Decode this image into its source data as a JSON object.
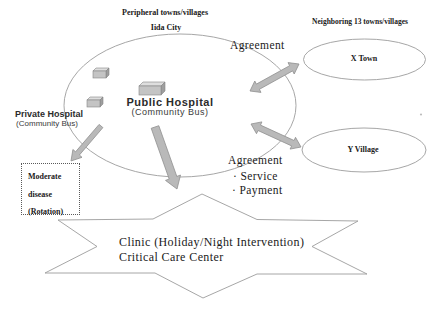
{
  "headers": {
    "peripheral_line1": "Peripheral towns/villages",
    "peripheral_line2": "Iida City",
    "neighboring": "Neighboring 13 towns/villages"
  },
  "main_ellipse": {
    "hospital_name": "Public Hospital",
    "hospital_sub": "(Community Bus)"
  },
  "private_hospital": {
    "name": "Private Hospital",
    "sub": "(Community Bus)"
  },
  "agreements": {
    "top_label": "Agreement",
    "bottom_label": "Agreement",
    "bottom_items": [
      "· Service",
      "· Payment"
    ]
  },
  "neighbors": {
    "x_town": "X Town",
    "y_village": "Y Village"
  },
  "moderate_box": {
    "lines": [
      "Moderate",
      "disease",
      "(Rotation)"
    ]
  },
  "burst": {
    "line1": "Clinic (Holiday/Night Intervention)",
    "line2": "Critical Care Center"
  },
  "icons": {
    "community_bus": "3d-box-shape"
  },
  "colors": {
    "arrow_fill": "#b9b9b9",
    "arrow_stroke": "#8f8f8f",
    "shape_stroke": "#9c9c9c",
    "bus_front": "#c4c4c4",
    "bus_top": "#dedede",
    "bus_side": "#9e9e9e",
    "text": "#1a1a1a"
  }
}
